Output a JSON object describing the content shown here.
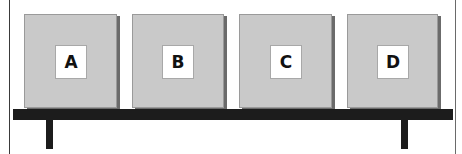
{
  "diagram": {
    "boxes": [
      {
        "label": "A",
        "left": 24,
        "width": 91,
        "card_left": 30
      },
      {
        "label": "B",
        "left": 132,
        "width": 90,
        "card_left": 29
      },
      {
        "label": "C",
        "left": 239,
        "width": 91,
        "card_left": 30
      },
      {
        "label": "D",
        "left": 347,
        "width": 89,
        "card_left": 29
      }
    ],
    "colors": {
      "box_fill": "#c9c9c9",
      "box_shadow": "#6b6b6b",
      "label_card": "#ffffff",
      "shelf": "#1c1c1c",
      "background": "#ffffff"
    }
  }
}
